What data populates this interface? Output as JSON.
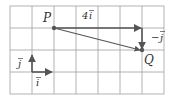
{
  "diagram": {
    "grid": {
      "x0": 10,
      "y0": 6,
      "cell": 22,
      "cols": 7,
      "rows": 4,
      "color": "#9a9a9a"
    },
    "points": {
      "P": {
        "label": "P",
        "x": 55,
        "y": 29
      },
      "Q": {
        "label": "Q",
        "x": 143,
        "y": 51
      }
    },
    "vectors": {
      "four_i": {
        "label": "4i⃗",
        "text_main": "4",
        "text_var": "i"
      },
      "minus_j": {
        "label": "−j⃗",
        "text_main": "−",
        "text_var": "j"
      },
      "unit_j": {
        "label": "j⃗",
        "text_var": "j"
      },
      "unit_i": {
        "label": "i⃗",
        "text_var": "i"
      }
    },
    "colors": {
      "arrow": "#555555",
      "point": "#555555",
      "text": "#333333"
    }
  }
}
